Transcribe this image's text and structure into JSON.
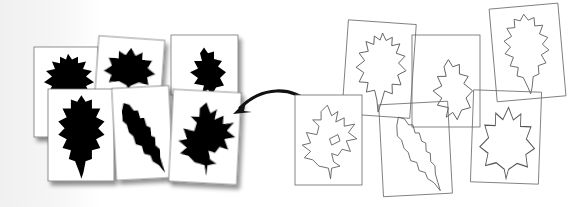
{
  "figure": {
    "colors": {
      "silhouette": "#000000",
      "card_fill": "#ffffff",
      "card_border": "#777777",
      "outline_stroke": "#555555",
      "arrow": "#111111",
      "shadow": "#b0b0b0"
    },
    "silhouette_cards": [
      {
        "id": "s1",
        "leaf": "oak-broad"
      },
      {
        "id": "s2",
        "leaf": "maple-like"
      },
      {
        "id": "s3",
        "leaf": "oak-small"
      },
      {
        "id": "s4",
        "leaf": "oak-elongated"
      },
      {
        "id": "s5",
        "leaf": "narrow-serrate"
      },
      {
        "id": "s6",
        "leaf": "pin-oak"
      }
    ],
    "outline_cards": [
      {
        "id": "o1",
        "leaf": "pin-oak"
      },
      {
        "id": "o2",
        "leaf": "oak-broad"
      },
      {
        "id": "o3",
        "leaf": "oak-small"
      },
      {
        "id": "o4",
        "leaf": "narrow-serrate"
      },
      {
        "id": "o5",
        "leaf": "oak-elongated"
      },
      {
        "id": "o6",
        "leaf": "maple-like"
      }
    ],
    "arrow": {
      "from": "outline-card-pin-oak",
      "to": "silhouette-card-pin-oak",
      "direction": "right-to-left"
    }
  }
}
